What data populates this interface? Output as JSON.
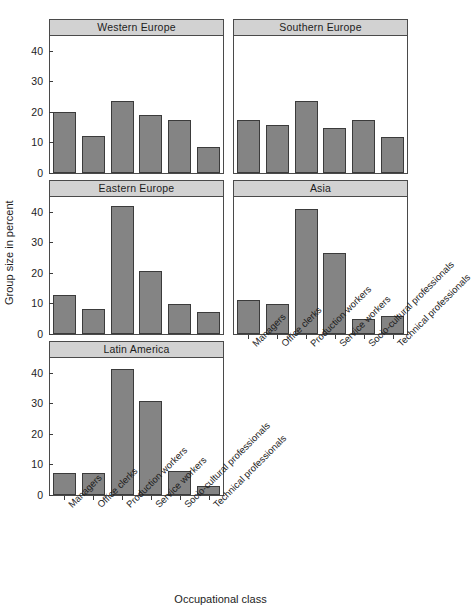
{
  "chart_data": {
    "type": "bar",
    "title": "",
    "subtitle": "",
    "xlabel": "Occupational class",
    "ylabel": "Group size in percent",
    "ylim": [
      0,
      45
    ],
    "yticks": [
      0,
      10,
      20,
      30,
      40
    ],
    "ytick_labels": [
      "0",
      "10",
      "20",
      "30",
      "40"
    ],
    "grid": false,
    "legend": "none",
    "layout": "faceted 3 rows x 2 columns, bottom-right facet empty",
    "bar_color": "#848484",
    "bar_edge_color": "#3b3b3b",
    "strip_color": "#d2d2d2",
    "panel_border_color": "#4a4a4a",
    "categories": [
      "Managers",
      "Office clerks",
      "Production workers",
      "Service workers",
      "Socio-cultural professionals",
      "Technical professionals"
    ],
    "panels": [
      {
        "name": "Western Europe",
        "values": [
          20.0,
          12.0,
          23.5,
          19.0,
          17.3,
          8.7
        ]
      },
      {
        "name": "Southern Europe",
        "values": [
          17.3,
          15.8,
          23.8,
          14.9,
          17.5,
          11.7
        ]
      },
      {
        "name": "Eastern Europe",
        "values": [
          12.8,
          8.2,
          41.9,
          20.8,
          10.0,
          7.2
        ]
      },
      {
        "name": "Asia",
        "values": [
          11.3,
          9.9,
          41.0,
          26.7,
          4.8,
          5.8
        ]
      },
      {
        "name": "Latin America",
        "values": [
          7.2,
          7.2,
          41.5,
          30.8,
          8.0,
          3.0
        ]
      }
    ]
  }
}
